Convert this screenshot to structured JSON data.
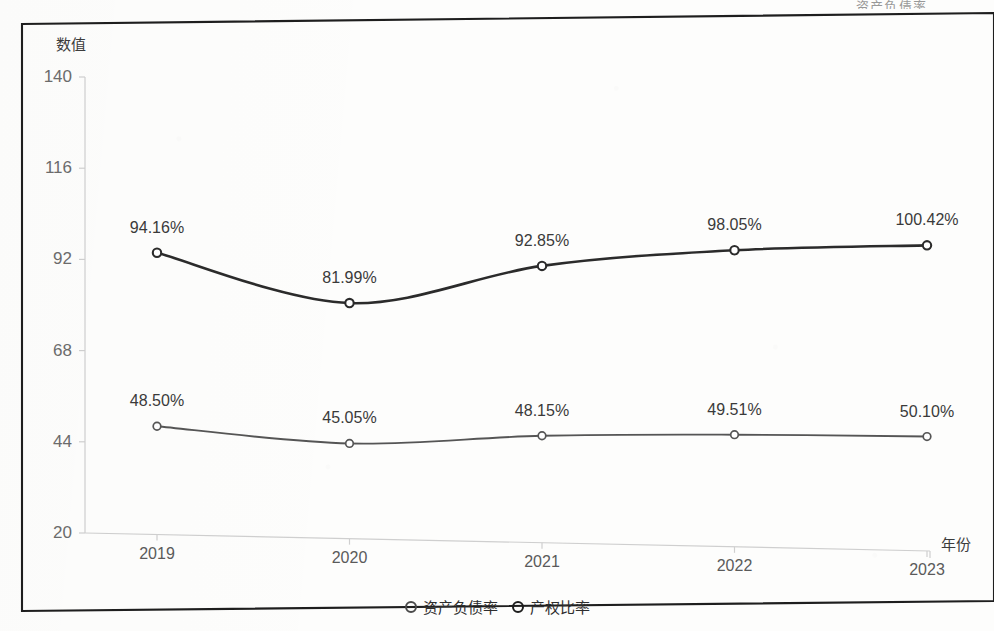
{
  "scan": {
    "cropped_top_text": "资产负债率"
  },
  "chart_data": {
    "type": "line",
    "title": "",
    "xlabel": "年份",
    "ylabel": "数值",
    "categories": [
      "2019",
      "2020",
      "2021",
      "2022",
      "2023"
    ],
    "x_tick_labels": [
      "2019",
      "2020",
      "2021",
      "2022",
      "2023"
    ],
    "y_tick_labels": [
      "20",
      "44",
      "68",
      "92",
      "116",
      "140"
    ],
    "y_tick_values": [
      20,
      44,
      68,
      92,
      116,
      140
    ],
    "ylim": [
      20,
      140
    ],
    "grid": false,
    "legend_position": "bottom-center",
    "marker": "open-circle",
    "line_style": "smooth-spline",
    "series": [
      {
        "name": "资产负债率",
        "color": "#2b2b2b",
        "values": [
          94.16,
          81.99,
          92.85,
          98.05,
          100.42
        ],
        "labels": [
          "94.16%",
          "81.99%",
          "92.85%",
          "98.05%",
          "100.42%"
        ]
      },
      {
        "name": "产权比率",
        "color": "#555555",
        "values": [
          48.5,
          45.05,
          48.15,
          49.51,
          50.1
        ],
        "labels": [
          "48.50%",
          "45.05%",
          "48.15%",
          "49.51%",
          "50.10%"
        ]
      }
    ]
  },
  "legend": {
    "items": [
      {
        "label": "资产负债率"
      },
      {
        "label": "产权比率"
      }
    ]
  },
  "colors": {
    "series_primary": "#2b2b2b",
    "series_secondary": "#555555",
    "axis": "#cfcfcf",
    "frame": "#1e1e1e",
    "tick_text": "#6c6c6c"
  }
}
